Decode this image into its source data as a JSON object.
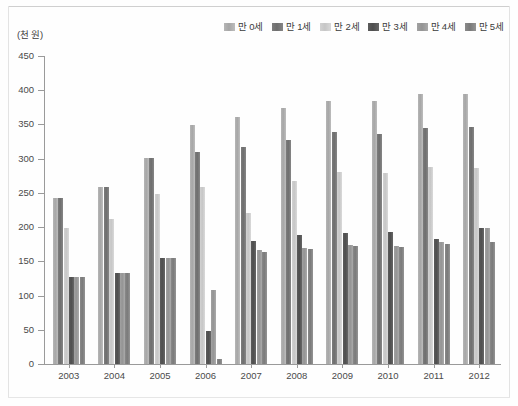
{
  "chart_data": {
    "type": "bar",
    "title": "",
    "subtitle": "",
    "xlabel": "",
    "ylabel": "",
    "unit_label": "(천 원)",
    "categories": [
      "2003",
      "2004",
      "2005",
      "2006",
      "2007",
      "2008",
      "2009",
      "2010",
      "2011",
      "2012"
    ],
    "ylim": [
      0,
      450
    ],
    "yticks": [
      0,
      50,
      100,
      150,
      200,
      250,
      300,
      350,
      400,
      450
    ],
    "ytick_labels": [
      "0",
      "50",
      "100",
      "150",
      "200",
      "250",
      "300",
      "350",
      "400",
      "450"
    ],
    "grid": false,
    "legend_position": "top-right",
    "series": [
      {
        "name": "만 0세",
        "color": "#b0b0b0",
        "values": [
          243,
          259,
          301,
          349,
          361,
          374,
          384,
          384,
          395,
          395
        ]
      },
      {
        "name": "만 1세",
        "color": "#767676",
        "values": [
          243,
          259,
          301,
          310,
          317,
          328,
          339,
          336,
          345,
          346
        ]
      },
      {
        "name": "만 2세",
        "color": "#cbcbcb",
        "values": [
          199,
          212,
          248,
          258,
          220,
          268,
          280,
          279,
          288,
          287
        ]
      },
      {
        "name": "만 3세",
        "color": "#545454",
        "values": [
          127,
          133,
          155,
          48,
          180,
          188,
          192,
          193,
          182,
          199
        ]
      },
      {
        "name": "만 4세",
        "color": "#9b9b9b",
        "values": [
          127,
          133,
          155,
          108,
          166,
          170,
          174,
          172,
          178,
          199
        ]
      },
      {
        "name": "만 5세",
        "color": "#828282",
        "values": [
          127,
          133,
          155,
          8,
          163,
          168,
          172,
          171,
          176,
          179
        ]
      }
    ]
  }
}
